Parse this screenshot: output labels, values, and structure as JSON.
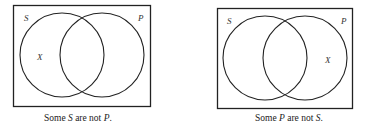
{
  "diagrams": [
    {
      "labels": {
        "left_set": "S",
        "right_set": "P",
        "marker": "X"
      },
      "marker_region": "S outside P",
      "caption": {
        "pre": "Some ",
        "term1": "S",
        "mid": " are not ",
        "term2": "P",
        "post": "."
      }
    },
    {
      "labels": {
        "left_set": "S",
        "right_set": "P",
        "marker": "X"
      },
      "marker_region": "P outside S",
      "caption": {
        "pre": "Some ",
        "term1": "P",
        "mid": " are not ",
        "term2": "S",
        "post": "."
      }
    }
  ],
  "colors": {
    "stroke": "#222222",
    "background": "#ffffff"
  }
}
